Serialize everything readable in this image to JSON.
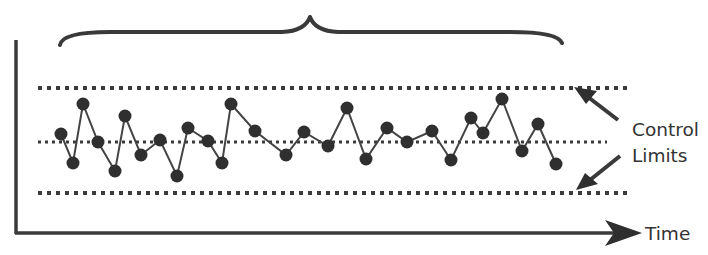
{
  "diagram": {
    "colors": {
      "background": "#ffffff",
      "ink": "#3a3a3a",
      "text": "#333333",
      "marker": "#2f2f2f"
    },
    "labels": {
      "control_limits_line1": "Control",
      "control_limits_line2": "Limits",
      "x_axis": "Time"
    },
    "lines": {
      "upper_control_limit_y": 88,
      "center_line_y": 142,
      "lower_control_limit_y": 193
    }
  },
  "chart_data": {
    "type": "line",
    "title": "",
    "xlabel": "Time",
    "ylabel": "",
    "annotations": [
      "Control Limits",
      "brace spanning all samples"
    ],
    "grid": false,
    "legend": "none",
    "reference_lines": [
      {
        "name": "Upper Control Limit",
        "style": "dotted",
        "y_px": 88
      },
      {
        "name": "Center Line",
        "style": "dotted",
        "y_px": 142
      },
      {
        "name": "Lower Control Limit",
        "style": "dotted",
        "y_px": 193
      }
    ],
    "points_px": [
      [
        61,
        134
      ],
      [
        73,
        163
      ],
      [
        83,
        104
      ],
      [
        98,
        142
      ],
      [
        115,
        171
      ],
      [
        125,
        116
      ],
      [
        141,
        155
      ],
      [
        160,
        140
      ],
      [
        177,
        176
      ],
      [
        188,
        128
      ],
      [
        208,
        141
      ],
      [
        222,
        163
      ],
      [
        231,
        104
      ],
      [
        255,
        131
      ],
      [
        286,
        155
      ],
      [
        304,
        132
      ],
      [
        328,
        146
      ],
      [
        347,
        108
      ],
      [
        366,
        159
      ],
      [
        387,
        128
      ],
      [
        407,
        142
      ],
      [
        432,
        131
      ],
      [
        451,
        160
      ],
      [
        471,
        118
      ],
      [
        483,
        133
      ],
      [
        502,
        99
      ],
      [
        522,
        151
      ],
      [
        538,
        124
      ],
      [
        556,
        164
      ]
    ],
    "series": [
      {
        "name": "Process measurement (relative to center line, + = above)",
        "values": [
          8,
          -21,
          38,
          0,
          -29,
          26,
          -13,
          2,
          -34,
          14,
          1,
          -21,
          38,
          11,
          -13,
          10,
          -4,
          34,
          -17,
          14,
          0,
          11,
          -18,
          24,
          9,
          43,
          -9,
          18,
          -22
        ]
      }
    ]
  }
}
